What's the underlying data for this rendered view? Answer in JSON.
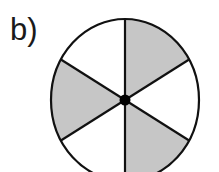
{
  "figure": {
    "label": "b)",
    "sectors_total": 6,
    "sectors_shaded": 3,
    "shaded_fraction": "1/2",
    "colors": {
      "shade": "#c6c6c6",
      "stroke": "#111111",
      "background": "#ffffff"
    }
  }
}
